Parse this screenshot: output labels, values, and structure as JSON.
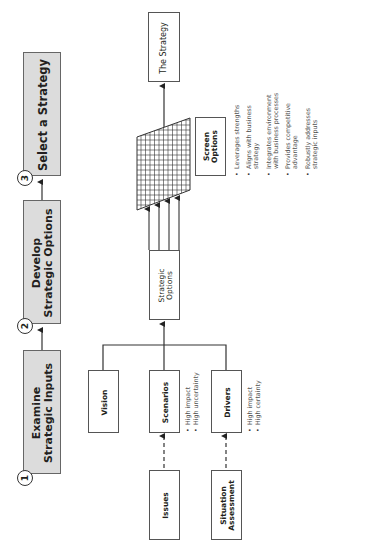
{
  "stages": [
    {
      "number": "1",
      "label_line1": "Examine",
      "label_line2": "Strategic Inputs"
    },
    {
      "number": "2",
      "label_line1": "Develop",
      "label_line2": "Strategic Options"
    },
    {
      "number": "3",
      "label_line1": "Select a Strategy",
      "label_line2": ""
    }
  ],
  "boxes": {
    "the_strategy": "The Strategy",
    "screen_options_line1": "Screen",
    "screen_options_line2": "Options",
    "strategic_options_line1": "Strategic",
    "strategic_options_line2": "Options",
    "vision": "Vision",
    "scenarios": "Scenarios",
    "drivers": "Drivers",
    "issues": "Issues",
    "situation_line1": "Situation",
    "situation_line2": "Assessment"
  },
  "scenarios_bullets": [
    "High impact",
    "High uncertainty"
  ],
  "drivers_bullets": [
    "High impact",
    "High certainty"
  ],
  "screen_criteria": [
    {
      "line1": "Leverages strengths",
      "line2": ""
    },
    {
      "line1": "Aligns with business",
      "line2": "strategy"
    },
    {
      "line1": "Integrates environment",
      "line2": "with business processes"
    },
    {
      "line1": "Provides competitive",
      "line2": "advantage"
    },
    {
      "line1": "Robustly addresses",
      "line2": "strategic inputs"
    }
  ],
  "colors": {
    "stage_fill": "#dcdcdc",
    "line": "#333333",
    "text": "#231f20"
  }
}
